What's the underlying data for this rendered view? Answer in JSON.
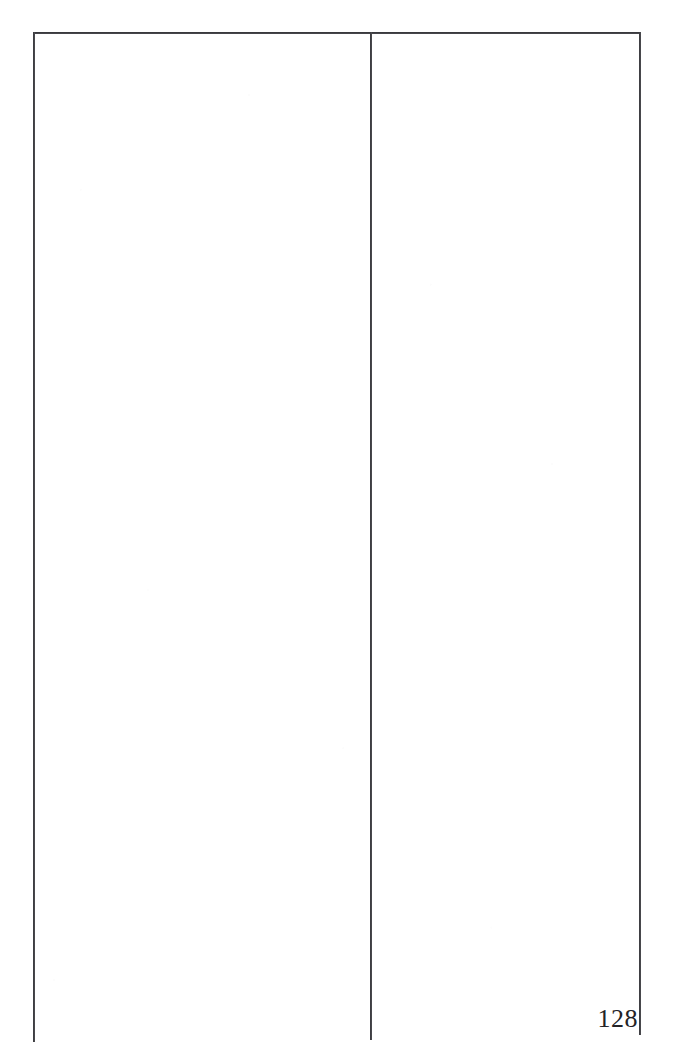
{
  "document": {
    "page_number": "128",
    "page_content_left_column": "",
    "page_content_right_column": "",
    "ink_color": "#232327",
    "paper_color": "#ffffff"
  },
  "frame": {
    "top_rule": "",
    "left_rule": "",
    "middle_rule": "",
    "right_rule": ""
  }
}
